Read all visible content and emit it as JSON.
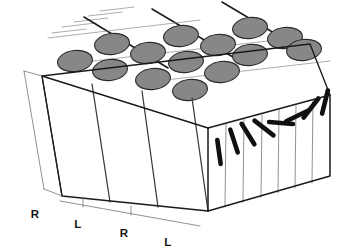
{
  "figure": {
    "kind": "3d-block-diagram",
    "background_color": "#ffffff",
    "outline_color": "#1a1a1a",
    "slab_line_color": "#3a3a3a",
    "thin_line_color": "#6e6e6e",
    "blob_fill_color": "#878787",
    "blob_outline_color": "#2b2b2b",
    "bar_color": "#101010"
  },
  "geometry": {
    "block_top_back_left": [
      42,
      76
    ],
    "block_top_back_right": [
      310,
      44
    ],
    "block_top_front_right": [
      330,
      95
    ],
    "block_top_front_left": [
      208,
      128
    ],
    "block_bottom_front_left": [
      62,
      196
    ],
    "block_bottom_front_right": [
      208,
      211
    ],
    "block_bottom_right": [
      330,
      176
    ],
    "block_bottom_back_left": [
      42,
      150
    ]
  },
  "ocular_dominance_labels": [
    {
      "text": "R",
      "x": 35,
      "y": 218,
      "eye": "right"
    },
    {
      "text": "L",
      "x": 78,
      "y": 228,
      "eye": "left"
    },
    {
      "text": "R",
      "x": 124,
      "y": 237,
      "eye": "right"
    },
    {
      "text": "L",
      "x": 168,
      "y": 246,
      "eye": "left"
    }
  ],
  "ocular_dominance_columns": {
    "label": "Ocular dominance slabs",
    "order": [
      "R",
      "L",
      "R",
      "L"
    ],
    "count": 4
  },
  "blobs": {
    "label": "Cytochrome oxidase blobs",
    "fill": "#878787",
    "outline": "#2b2b2b",
    "rx": 17.5,
    "ry": 10.5,
    "rotation_deg": -7,
    "items": [
      {
        "cx": 112,
        "cy": 44,
        "row": 1,
        "col": 1
      },
      {
        "cx": 181,
        "cy": 36,
        "row": 1,
        "col": 2
      },
      {
        "cx": 250,
        "cy": 28,
        "row": 1,
        "col": 3
      },
      {
        "cx": 75,
        "cy": 61,
        "row": 2,
        "col": 1
      },
      {
        "cx": 148,
        "cy": 53,
        "row": 2,
        "col": 2
      },
      {
        "cx": 218,
        "cy": 45,
        "row": 2,
        "col": 3
      },
      {
        "cx": 285,
        "cy": 38,
        "row": 2,
        "col": 4
      },
      {
        "cx": 110,
        "cy": 70,
        "row": 3,
        "col": 2
      },
      {
        "cx": 186,
        "cy": 62,
        "row": 3,
        "col": 3
      },
      {
        "cx": 250,
        "cy": 55,
        "row": 3,
        "col": 4
      },
      {
        "cx": 304,
        "cy": 50,
        "row": 3,
        "col": 5
      },
      {
        "cx": 153,
        "cy": 79,
        "row": 4,
        "col": 3
      },
      {
        "cx": 222,
        "cy": 72,
        "row": 4,
        "col": 4
      },
      {
        "cx": 190,
        "cy": 90,
        "row": 5,
        "col": 4
      }
    ]
  },
  "orientation_columns": {
    "label": "Orientation columns",
    "description": "Progressive rotation of preferred orientation across adjacent slabs",
    "bars": [
      {
        "cx": 219,
        "cy": 152,
        "angle_deg": 82,
        "length": 24
      },
      {
        "cx": 234,
        "cy": 141,
        "angle_deg": 72,
        "length": 24
      },
      {
        "cx": 248,
        "cy": 134,
        "angle_deg": 58,
        "length": 24
      },
      {
        "cx": 264,
        "cy": 128,
        "angle_deg": 38,
        "length": 24
      },
      {
        "cx": 281,
        "cy": 123,
        "angle_deg": 5,
        "length": 24
      },
      {
        "cx": 297,
        "cy": 116,
        "angle_deg": -26,
        "length": 24
      },
      {
        "cx": 311,
        "cy": 108,
        "angle_deg": -52,
        "length": 24
      },
      {
        "cx": 325,
        "cy": 102,
        "angle_deg": -76,
        "length": 24
      }
    ]
  },
  "top_grid": {
    "major_lines": [
      {
        "x1": 84,
        "y1": 17,
        "x2": 168,
        "y2": 68
      },
      {
        "x1": 152,
        "y1": 9,
        "x2": 238,
        "y2": 60
      },
      {
        "x1": 222,
        "y1": 2,
        "x2": 306,
        "y2": 52
      },
      {
        "x1": 48,
        "y1": 38,
        "x2": 200,
        "y2": 20
      },
      {
        "x1": 84,
        "y1": 62,
        "x2": 268,
        "y2": 41
      },
      {
        "x1": 140,
        "y1": 83,
        "x2": 330,
        "y2": 61
      }
    ],
    "minor_lines": [
      {
        "x1": 52,
        "y1": 33,
        "x2": 86,
        "y2": 29
      },
      {
        "x1": 62,
        "y1": 27,
        "x2": 96,
        "y2": 23
      },
      {
        "x1": 74,
        "y1": 22,
        "x2": 108,
        "y2": 18
      },
      {
        "x1": 88,
        "y1": 16,
        "x2": 122,
        "y2": 12
      },
      {
        "x1": 100,
        "y1": 11,
        "x2": 134,
        "y2": 7
      }
    ]
  },
  "front_face_dividers": [
    {
      "x1": 62,
      "y1": 196,
      "x2": 42,
      "y2": 76
    },
    {
      "x1": 110,
      "y1": 202,
      "x2": 92,
      "y2": 84
    },
    {
      "x1": 158,
      "y1": 207,
      "x2": 142,
      "y2": 91
    },
    {
      "x1": 208,
      "y1": 211,
      "x2": 192,
      "y2": 98
    }
  ],
  "right_face_dividers": [
    {
      "x1": 208,
      "y1": 211,
      "x2": 208,
      "y2": 128
    },
    {
      "x1": 225,
      "y1": 207,
      "x2": 226,
      "y2": 124
    },
    {
      "x1": 243,
      "y1": 202,
      "x2": 244,
      "y2": 119
    },
    {
      "x1": 261,
      "y1": 197,
      "x2": 262,
      "y2": 115
    },
    {
      "x1": 278,
      "y1": 193,
      "x2": 279,
      "y2": 110
    },
    {
      "x1": 295,
      "y1": 188,
      "x2": 296,
      "y2": 106
    },
    {
      "x1": 312,
      "y1": 183,
      "x2": 313,
      "y2": 101
    },
    {
      "x1": 330,
      "y1": 176,
      "x2": 330,
      "y2": 95
    }
  ]
}
